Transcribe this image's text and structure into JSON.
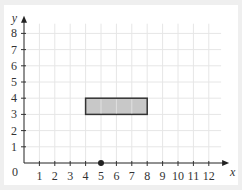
{
  "chart_data": {
    "type": "scatter",
    "title": "",
    "xlabel": "x",
    "ylabel": "y",
    "xlim": [
      0,
      12.8
    ],
    "ylim": [
      0,
      8.6
    ],
    "x_ticks": [
      1,
      2,
      3,
      4,
      5,
      6,
      7,
      8,
      9,
      10,
      11,
      12
    ],
    "y_ticks": [
      1,
      2,
      3,
      4,
      5,
      6,
      7,
      8
    ],
    "origin_label": "0",
    "grid": true,
    "points": [
      {
        "x": 5,
        "y": 0,
        "color": "#222222"
      }
    ],
    "shapes": [
      {
        "type": "rectangle",
        "x0": 4,
        "y0": 3,
        "x1": 8,
        "y1": 4,
        "fill": "#c8c8c8",
        "stroke": "#333333"
      }
    ]
  }
}
